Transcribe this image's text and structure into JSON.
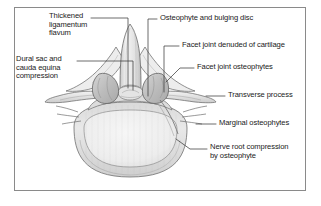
{
  "figure": {
    "background_color": "#ffffff",
    "frame_color": "#8a8a8a",
    "leader_color": "#3c3c3c",
    "ink_color": "#5a5a5a",
    "bone_fill": "#e6e6e6",
    "bone_fill_light": "#f2f2f2",
    "bone_shadow": "#bdbdbd"
  },
  "annotations": [
    {
      "id": "thickened-ligamentum-flavum",
      "text": "Thickened\nligamentum\nflavum",
      "side": "left",
      "x": 49,
      "y": 14
    },
    {
      "id": "dural-sac-cauda-equina-compression",
      "text": "Dural sac and\ncauda equina\ncompression",
      "side": "left",
      "x": 16,
      "y": 57
    },
    {
      "id": "osteophyte-and-bulging-disc",
      "text": "Osteophyte and bulging disc",
      "side": "right",
      "x": 160,
      "y": 15
    },
    {
      "id": "facet-joint-denuded-of-cartilage",
      "text": "Facet joint denuded of cartilage",
      "side": "right",
      "x": 182,
      "y": 42
    },
    {
      "id": "facet-joint-osteophytes",
      "text": "Facet joint osteophytes",
      "side": "right",
      "x": 197,
      "y": 64
    },
    {
      "id": "transverse-process",
      "text": "Transverse process",
      "side": "right",
      "x": 228,
      "y": 92
    },
    {
      "id": "marginal-osteophytes",
      "text": "Marginal osteophytes",
      "side": "right",
      "x": 219,
      "y": 120
    },
    {
      "id": "nerve-root-compression-by-osteophyte",
      "text": "Nerve root compression\nby osteophyte",
      "side": "right",
      "x": 210,
      "y": 145
    }
  ],
  "anatomy": {
    "parts": [
      "spinous-process",
      "lamina",
      "ligamentum-flavum",
      "spinal-canal",
      "facet-joint-left",
      "facet-joint-right",
      "transverse-process-left",
      "transverse-process-right",
      "vertebral-body",
      "marginal-osteophyte-left",
      "marginal-osteophyte-right",
      "nerve-root"
    ]
  }
}
